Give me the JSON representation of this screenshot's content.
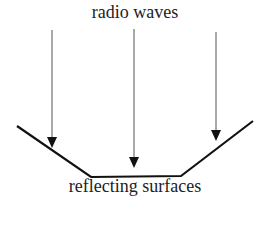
{
  "diagram": {
    "top_label": "radio waves",
    "bottom_label": "reflecting surfaces",
    "arrows": [
      {
        "x": 52,
        "y1": 30,
        "y2": 148
      },
      {
        "x": 134,
        "y1": 29,
        "y2": 168
      },
      {
        "x": 216,
        "y1": 32,
        "y2": 141
      }
    ],
    "surface_points": [
      [
        17,
        126
      ],
      [
        91,
        177
      ],
      [
        181,
        176
      ],
      [
        253,
        121
      ]
    ],
    "colors": {
      "line": "#111111",
      "arrow_shaft": "#555555"
    }
  }
}
